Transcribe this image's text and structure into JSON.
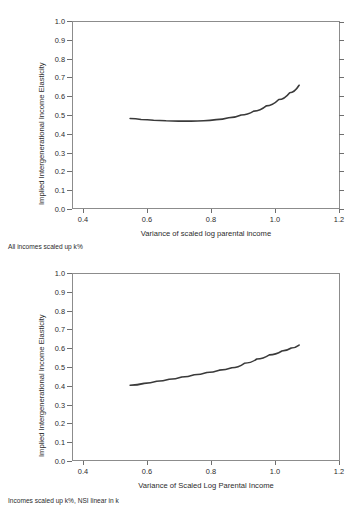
{
  "chart_data": [
    {
      "type": "line",
      "title": "",
      "xlabel": "Variance of scaled log parental income",
      "ylabel": "Implied Intergenerational Income Elasticity",
      "caption": "All incomes scaled up k%",
      "xlim": [
        0.4,
        1.2
      ],
      "ylim": [
        0.0,
        1.0
      ],
      "xticks": [
        "0.4",
        "0.6",
        "0.8",
        "1.0",
        "1.2"
      ],
      "xtick_values": [
        0.4,
        0.6,
        0.8,
        1.0,
        1.2
      ],
      "yticks": [
        "0.0",
        "0.1",
        "0.2",
        "0.3",
        "0.4",
        "0.5",
        "0.6",
        "0.7",
        "0.8",
        "0.9",
        "1.0"
      ],
      "ytick_values": [
        0.0,
        0.1,
        0.2,
        0.3,
        0.4,
        0.5,
        0.6,
        0.7,
        0.8,
        0.9,
        1.0
      ],
      "grid": false,
      "legend": "none",
      "series": [
        {
          "name": "Implied elasticity",
          "color": "#3a3a3a",
          "x": [
            0.545,
            0.58,
            0.62,
            0.66,
            0.7,
            0.74,
            0.78,
            0.82,
            0.86,
            0.9,
            0.94,
            0.98,
            1.02,
            1.055,
            1.085
          ],
          "y": [
            0.481,
            0.476,
            0.472,
            0.469,
            0.467,
            0.467,
            0.469,
            0.475,
            0.485,
            0.5,
            0.521,
            0.549,
            0.583,
            0.62,
            0.66
          ]
        }
      ]
    },
    {
      "type": "line",
      "title": "",
      "xlabel": "Variance of Scaled Log Parental Income",
      "ylabel": "Implied Intergenerational Income Elasticity",
      "caption": "Incomes scaled up k%, NSI linear in k",
      "xlim": [
        0.4,
        1.2
      ],
      "ylim": [
        0.0,
        1.0
      ],
      "xticks": [
        "0.4",
        "0.6",
        "0.8",
        "1.0",
        "1.2"
      ],
      "xtick_values": [
        0.4,
        0.6,
        0.8,
        1.0,
        1.2
      ],
      "yticks": [
        "0.0",
        "0.1",
        "0.2",
        "0.3",
        "0.4",
        "0.5",
        "0.6",
        "0.7",
        "0.8",
        "0.9",
        "1.0"
      ],
      "ytick_values": [
        0.0,
        0.1,
        0.2,
        0.3,
        0.4,
        0.5,
        0.6,
        0.7,
        0.8,
        0.9,
        1.0
      ],
      "grid": false,
      "legend": "none",
      "series": [
        {
          "name": "Implied elasticity",
          "color": "#3a3a3a",
          "x": [
            0.545,
            0.59,
            0.63,
            0.67,
            0.71,
            0.75,
            0.79,
            0.83,
            0.87,
            0.91,
            0.95,
            0.99,
            1.03,
            1.06,
            1.085
          ],
          "y": [
            0.402,
            0.412,
            0.423,
            0.434,
            0.446,
            0.458,
            0.47,
            0.483,
            0.496,
            0.52,
            0.543,
            0.565,
            0.586,
            0.602,
            0.618
          ]
        }
      ]
    }
  ],
  "panels": [
    {
      "xlabel": "Variance of scaled log parental income",
      "ylabel": "Implied Intergenerational Income Elasticity",
      "caption": "All incomes scaled up k%"
    },
    {
      "xlabel": "Variance of Scaled Log Parental Income",
      "ylabel": "Implied Intergenerational Income Elasticity",
      "caption": "Incomes scaled up k%, NSI linear in k"
    }
  ]
}
